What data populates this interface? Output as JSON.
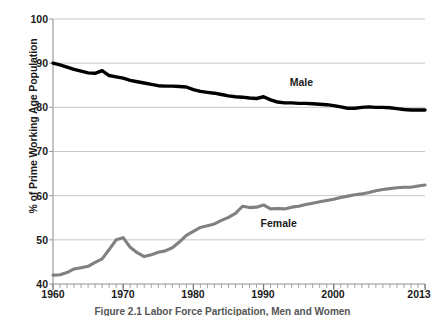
{
  "chart_data": {
    "type": "line",
    "title": "",
    "caption": "Figure 2.1  Labor Force Participation, Men and Women",
    "xlabel": "",
    "ylabel": "% of Prime Working Age Population",
    "xlim": [
      1960,
      2013
    ],
    "ylim": [
      40,
      100
    ],
    "yticks": [
      40,
      50,
      60,
      70,
      80,
      90,
      100
    ],
    "xticks": [
      1960,
      1970,
      1980,
      1990,
      2000,
      2013
    ],
    "grid": "horizontal",
    "legend_position": "inline-annotation",
    "minor_xticks": "every-year",
    "colors": {
      "male": "#000000",
      "female": "#808080",
      "grid": "#c8c8c8",
      "axis": "#b0b0b0"
    },
    "annotations": [
      {
        "text": "Male",
        "x": 1996,
        "y": 85.5
      },
      {
        "text": "Female",
        "x": 1993,
        "y": 53.5
      }
    ],
    "x": [
      1960,
      1961,
      1962,
      1963,
      1964,
      1965,
      1966,
      1967,
      1968,
      1969,
      1970,
      1971,
      1972,
      1973,
      1974,
      1975,
      1976,
      1977,
      1978,
      1979,
      1980,
      1981,
      1982,
      1983,
      1984,
      1985,
      1986,
      1987,
      1988,
      1989,
      1990,
      1991,
      1992,
      1993,
      1994,
      1995,
      1996,
      1997,
      1998,
      1999,
      2000,
      2001,
      2002,
      2003,
      2004,
      2005,
      2006,
      2007,
      2008,
      2009,
      2010,
      2011,
      2012,
      2013
    ],
    "series": [
      {
        "name": "Male",
        "color": "#000000",
        "values": [
          90.0,
          89.6,
          89.1,
          88.6,
          88.2,
          87.8,
          87.7,
          88.3,
          87.2,
          86.9,
          86.6,
          86.1,
          85.8,
          85.5,
          85.2,
          84.9,
          84.8,
          84.8,
          84.7,
          84.6,
          84.0,
          83.6,
          83.4,
          83.2,
          82.9,
          82.6,
          82.4,
          82.3,
          82.1,
          82.0,
          82.4,
          81.7,
          81.2,
          81.0,
          81.0,
          80.9,
          80.9,
          80.8,
          80.7,
          80.6,
          80.4,
          80.1,
          79.8,
          79.8,
          80.0,
          80.1,
          80.0,
          80.0,
          79.9,
          79.7,
          79.5,
          79.4,
          79.4,
          79.4
        ]
      },
      {
        "name": "Female",
        "color": "#808080",
        "values": [
          42.0,
          42.1,
          42.6,
          43.4,
          43.7,
          44.0,
          44.9,
          45.7,
          47.8,
          50.0,
          50.5,
          48.3,
          47.1,
          46.2,
          46.6,
          47.2,
          47.5,
          48.2,
          49.5,
          51.0,
          51.9,
          52.8,
          53.2,
          53.6,
          54.4,
          55.1,
          56.0,
          57.6,
          57.3,
          57.4,
          57.9,
          57.0,
          57.1,
          57.0,
          57.4,
          57.6,
          58.0,
          58.3,
          58.6,
          58.9,
          59.2,
          59.6,
          59.9,
          60.2,
          60.4,
          60.7,
          61.1,
          61.4,
          61.6,
          61.8,
          61.9,
          61.9,
          62.2,
          62.4
        ]
      }
    ]
  },
  "axis_labels": {
    "y_ticks": [
      "100",
      "90",
      "80",
      "70",
      "60",
      "50",
      "40"
    ],
    "x_ticks": [
      "1960",
      "1970",
      "1980",
      "1990",
      "2000",
      "2013"
    ],
    "y_title": "% of Prime Working Age Population"
  },
  "annotations": {
    "male_label": "Male",
    "female_label": "Female"
  },
  "caption": {
    "text": "Figure 2.1  Labor Force Participation, Men and Women"
  }
}
